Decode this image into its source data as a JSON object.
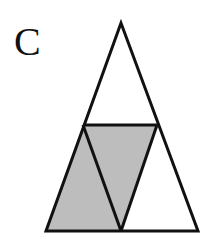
{
  "figure": {
    "label": "C",
    "shade_color": "#bdbdbd",
    "stroke_color": "#111111",
    "outer_triangle": {
      "apex": [
        121,
        23
      ],
      "base_left": [
        46,
        231
      ],
      "base_right": [
        198,
        231
      ]
    },
    "midline": {
      "left": [
        83,
        125
      ],
      "right": [
        157,
        125
      ]
    },
    "base_mid": [
      121,
      231
    ],
    "shaded_regions": [
      {
        "name": "left-triangle",
        "points": [
          [
            83,
            125
          ],
          [
            46,
            231
          ],
          [
            121,
            231
          ]
        ]
      },
      {
        "name": "inverted-triangle",
        "points": [
          [
            83,
            125
          ],
          [
            157,
            125
          ],
          [
            121,
            231
          ]
        ]
      }
    ]
  }
}
